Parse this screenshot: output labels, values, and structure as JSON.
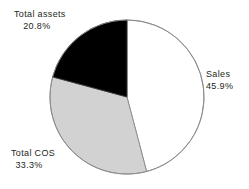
{
  "chart_data": {
    "type": "pie",
    "title": "",
    "subtitle": "",
    "xlabel": "",
    "ylabel": "",
    "legend_position": "none",
    "grid": false,
    "labels_position": "outside",
    "start_angle_deg": 0,
    "direction": "clockwise",
    "categories": [
      "Sales",
      "Total COS",
      "Total assets"
    ],
    "values": [
      45.9,
      33.3,
      20.8
    ],
    "value_labels": [
      "45.9%",
      "33.3%",
      "20.8%"
    ],
    "colors": [
      "#ffffff",
      "#d2d2d2",
      "#000000"
    ],
    "slices": [
      {
        "name": "Sales",
        "value": 45.9,
        "value_label": "45.9%",
        "color": "#ffffff",
        "start_deg": 0,
        "end_deg": 165.24
      },
      {
        "name": "Total COS",
        "value": 33.3,
        "value_label": "33.3%",
        "color": "#d2d2d2",
        "start_deg": 165.24,
        "end_deg": 285.12
      },
      {
        "name": "Total assets",
        "value": 20.8,
        "value_label": "20.8%",
        "color": "#000000",
        "start_deg": 285.12,
        "end_deg": 360
      }
    ]
  },
  "labels": {
    "total_assets": {
      "name": "Total assets",
      "value": "20.8%"
    },
    "sales": {
      "name": "Sales",
      "value": "45.9%"
    },
    "total_cos": {
      "name": "Total COS",
      "value": "33.3%"
    }
  },
  "style": {
    "background": "#ffffff",
    "outline": "#8a8a8a",
    "text": "#231f20"
  }
}
